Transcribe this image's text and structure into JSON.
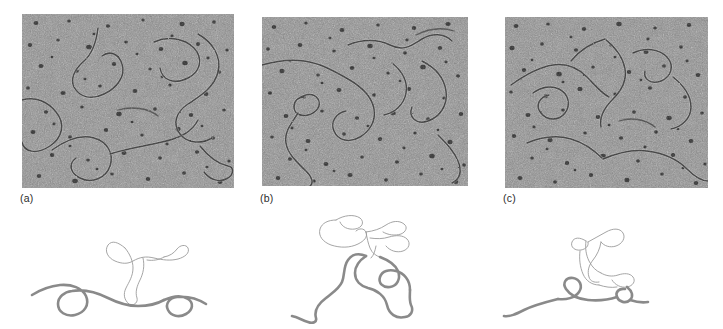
{
  "figure": {
    "type": "electron-micrograph-figure",
    "background_color": "#ffffff",
    "panel_count": 3,
    "description_alt": "Three electron micrographs of nucleic acid molecules with interpretive line tracings beneath each"
  },
  "panels": [
    {
      "id": "a",
      "label": "(a)",
      "micrograph": {
        "x": 22,
        "y": 14,
        "width": 212,
        "height": 174,
        "background_color": "#8d8d8d",
        "speckle_color": "#2e2e2e",
        "filament_color": "#4a4a4a",
        "highlight_color": "#c8c8c8"
      },
      "label_position": {
        "x": 20,
        "y": 193
      },
      "tracing": {
        "x": 30,
        "y": 220,
        "width": 200,
        "height": 105,
        "duplex_color": "#8a8a8a",
        "duplex_width": 2.6,
        "loop_color": "#9b9b9b",
        "loop_width": 0.9
      }
    },
    {
      "id": "b",
      "label": "(b)",
      "micrograph": {
        "x": 262,
        "y": 17,
        "width": 206,
        "height": 169,
        "background_color": "#8d8d8d",
        "speckle_color": "#2e2e2e",
        "filament_color": "#4a4a4a",
        "highlight_color": "#c8c8c8"
      },
      "label_position": {
        "x": 260,
        "y": 193
      },
      "tracing": {
        "x": 270,
        "y": 212,
        "width": 190,
        "height": 112,
        "duplex_color": "#8a8a8a",
        "duplex_width": 2.6,
        "loop_color": "#9b9b9b",
        "loop_width": 0.9
      }
    },
    {
      "id": "c",
      "label": "(c)",
      "micrograph": {
        "x": 505,
        "y": 17,
        "width": 203,
        "height": 171,
        "background_color": "#8d8d8d",
        "speckle_color": "#2e2e2e",
        "filament_color": "#4a4a4a",
        "highlight_color": "#c8c8c8"
      },
      "label_position": {
        "x": 503,
        "y": 193
      },
      "tracing": {
        "x": 500,
        "y": 215,
        "width": 200,
        "height": 105,
        "duplex_color": "#8a8a8a",
        "duplex_width": 2.6,
        "loop_color": "#9b9b9b",
        "loop_width": 0.9
      }
    }
  ]
}
